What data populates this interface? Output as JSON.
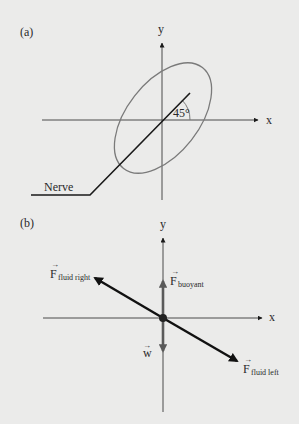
{
  "figure": {
    "panel_a": {
      "label": "(a)",
      "x_axis_label": "x",
      "y_axis_label": "y",
      "angle_label": "45°",
      "nerve_label": "Nerve"
    },
    "panel_b": {
      "label": "(b)",
      "x_axis_label": "x",
      "y_axis_label": "y",
      "forces": [
        {
          "symbol": "F",
          "subscript": "fluid right",
          "direction": "up-left"
        },
        {
          "symbol": "F",
          "subscript": "buoyant",
          "direction": "up"
        },
        {
          "symbol": "w",
          "subscript": "",
          "direction": "down"
        },
        {
          "symbol": "F",
          "subscript": "fluid left",
          "direction": "down-right"
        }
      ],
      "vector_arrow": "→"
    },
    "colors": {
      "background": "#ebebea",
      "axis": "#4a4a4a",
      "ellipse": "#7a7a7a",
      "nerve": "#1a1a1a",
      "vertical_forces": "#5a5a5a",
      "fluid_forces": "#111111",
      "text": "#2a2a2a"
    }
  }
}
